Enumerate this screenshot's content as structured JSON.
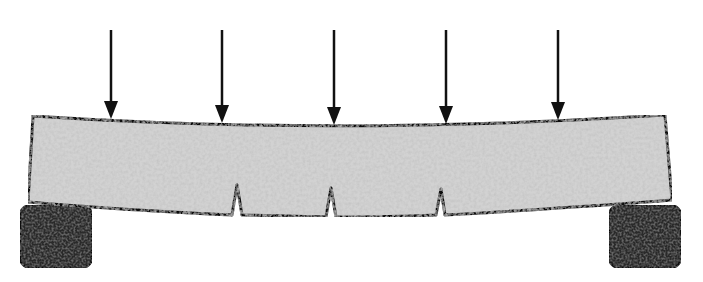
{
  "diagram": {
    "title": "",
    "subject": "concrete beam under distributed point loads, deflected with flexural cracks",
    "colors": {
      "background": "#ffffff",
      "beam_fill": "#cfcfcf",
      "beam_texture": "#a9a9a9",
      "outline": "#111111",
      "support_fill": "#2a2a2a",
      "arrow": "#111111"
    },
    "loads": [
      {
        "x": 111,
        "y_top": 30,
        "y_tip": 119
      },
      {
        "x": 222,
        "y_top": 30,
        "y_tip": 123
      },
      {
        "x": 334,
        "y_top": 30,
        "y_tip": 125
      },
      {
        "x": 446,
        "y_top": 30,
        "y_tip": 124
      },
      {
        "x": 558,
        "y_top": 30,
        "y_tip": 120
      }
    ],
    "beam": {
      "top_edge": [
        [
          33,
          116
        ],
        [
          111,
          120
        ],
        [
          222,
          124
        ],
        [
          334,
          126
        ],
        [
          446,
          125
        ],
        [
          558,
          121
        ],
        [
          665,
          115
        ]
      ],
      "bottom_edge": [
        [
          28,
          202
        ],
        [
          150,
          211
        ],
        [
          237,
          215
        ],
        [
          335,
          217
        ],
        [
          440,
          215
        ],
        [
          560,
          209
        ],
        [
          672,
          200
        ]
      ]
    },
    "cracks": [
      {
        "x": 237,
        "base_y": 215,
        "tip_y": 185
      },
      {
        "x": 331,
        "base_y": 217,
        "tip_y": 188
      },
      {
        "x": 440,
        "base_y": 215,
        "tip_y": 189
      }
    ],
    "supports": [
      {
        "side": "left",
        "x": 20,
        "y": 205,
        "w": 72,
        "h": 63
      },
      {
        "side": "right",
        "x": 609,
        "y": 205,
        "w": 72,
        "h": 63
      }
    ]
  }
}
